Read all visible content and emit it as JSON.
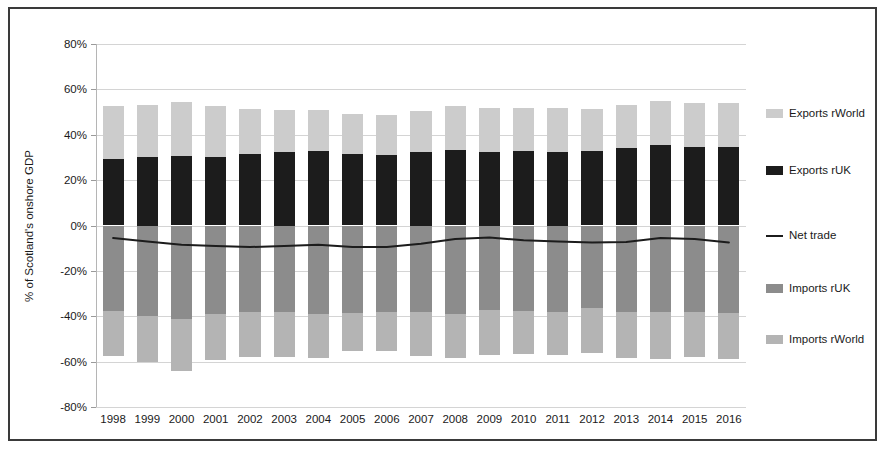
{
  "chart_data": {
    "type": "bar",
    "title": "",
    "subtitle": "",
    "xlabel": "",
    "ylabel": "% of Scotland's onshore GDP",
    "ylim": [
      -80,
      80
    ],
    "ytick_step": 20,
    "ytick_labels": [
      "80%",
      "60%",
      "40%",
      "20%",
      "0%",
      "-20%",
      "-40%",
      "-60%",
      "-80%"
    ],
    "ytick_values": [
      80,
      60,
      40,
      20,
      0,
      -20,
      -40,
      -60,
      -80
    ],
    "grid": true,
    "stacked": true,
    "legend_position": "right",
    "value_format": "percent",
    "categories": [
      "1998",
      "1999",
      "2000",
      "2001",
      "2002",
      "2003",
      "2004",
      "2005",
      "2006",
      "2007",
      "2008",
      "2009",
      "2010",
      "2011",
      "2012",
      "2013",
      "2014",
      "2015",
      "2016"
    ],
    "series": [
      {
        "name": "Exports rWorld",
        "color": "#cccccc",
        "type": "bar",
        "values": [
          23.0,
          23.0,
          23.7,
          22.3,
          19.8,
          18.5,
          18.0,
          17.5,
          17.5,
          18.0,
          19.2,
          19.5,
          19.3,
          19.5,
          18.8,
          19.3,
          19.5,
          19.0,
          19.3
        ]
      },
      {
        "name": "Exports rUK",
        "color": "#1c1c1c",
        "type": "bar",
        "values": [
          29.5,
          30.0,
          30.8,
          30.2,
          31.7,
          32.5,
          33.0,
          31.5,
          31.0,
          32.5,
          33.3,
          32.5,
          32.7,
          32.5,
          32.7,
          34.0,
          35.3,
          34.8,
          34.7
        ]
      },
      {
        "name": "Net trade",
        "color": "#1c1c1c",
        "type": "line",
        "values": [
          -5.5,
          -7.0,
          -8.5,
          -9.0,
          -9.5,
          -9.0,
          -8.5,
          -9.5,
          -9.5,
          -8.0,
          -6.0,
          -5.3,
          -6.5,
          -7.0,
          -7.5,
          -7.3,
          -5.5,
          -6.0,
          -7.5
        ]
      },
      {
        "name": "Imports rUK",
        "color": "#8c8c8c",
        "type": "bar",
        "values": [
          -37.5,
          -40.0,
          -41.0,
          -39.0,
          -38.3,
          -38.3,
          -38.8,
          -38.5,
          -38.0,
          -38.0,
          -38.8,
          -37.3,
          -37.5,
          -38.0,
          -36.3,
          -38.3,
          -38.3,
          -38.3,
          -38.5
        ]
      },
      {
        "name": "Imports rWorld",
        "color": "#b4b4b4",
        "type": "bar",
        "values": [
          -20.0,
          -20.0,
          -23.0,
          -20.5,
          -19.5,
          -19.5,
          -19.5,
          -17.0,
          -17.5,
          -19.5,
          -19.5,
          -20.0,
          -19.0,
          -19.0,
          -19.8,
          -20.0,
          -20.5,
          -19.5,
          -20.5
        ]
      }
    ],
    "legend_entries": [
      {
        "label": "Exports rWorld",
        "marker": "swatch",
        "color": "#cccccc"
      },
      {
        "label": "Exports rUK",
        "marker": "swatch",
        "color": "#1c1c1c"
      },
      {
        "label": "Net trade",
        "marker": "line",
        "color": "#1c1c1c"
      },
      {
        "label": "Imports rUK",
        "marker": "swatch",
        "color": "#8c8c8c"
      },
      {
        "label": "Imports rWorld",
        "marker": "swatch",
        "color": "#b4b4b4"
      }
    ]
  },
  "figure": {
    "border_color": "#3a3a3a",
    "background": "#ffffff",
    "gridline_color": "#d4d4d4"
  }
}
